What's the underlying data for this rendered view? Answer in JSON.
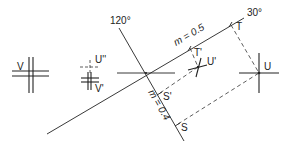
{
  "diagram": {
    "type": "geometric-construction",
    "axes": {
      "axis_30": {
        "angle_label": "30°",
        "scale_label": "m = 0.5"
      },
      "axis_120": {
        "angle_label": "120°",
        "scale_label": "m = 0.4"
      }
    },
    "points": {
      "U": "U",
      "U_prime": "U'",
      "U_double_prime": "U''",
      "V": "V",
      "V_prime": "V'",
      "T": "T",
      "T_prime": "T'",
      "S": "S",
      "S_prime": "S'"
    },
    "colors": {
      "line": "#222222",
      "background": "#ffffff"
    }
  }
}
